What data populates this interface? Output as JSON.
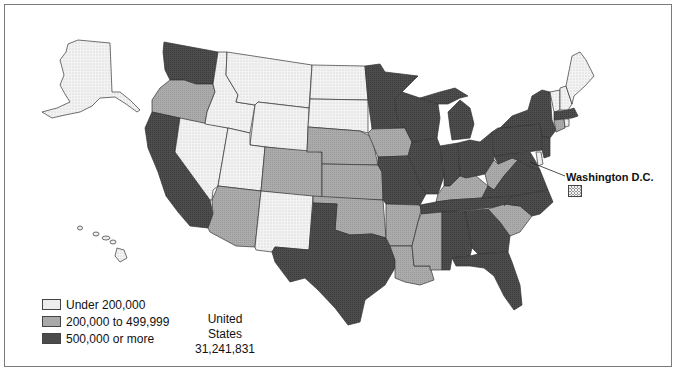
{
  "map": {
    "title": "",
    "total": {
      "label": "United States",
      "value": "31,241,831"
    },
    "dc_label": "Washington D.C.",
    "dc_category": "low"
  },
  "legend": {
    "items": [
      {
        "key": "low",
        "label": "Under 200,000",
        "color": "#f0f0f0"
      },
      {
        "key": "mid",
        "label": "200,000 to 499,999",
        "color": "#a8a8a8"
      },
      {
        "key": "high",
        "label": "500,000 or more",
        "color": "#4a4a4a"
      }
    ]
  },
  "colors": {
    "low": "#efefef",
    "mid": "#a9a9a9",
    "high": "#4b4b4b",
    "stroke": "#333333",
    "frame": "#7a7a7a"
  },
  "states": {
    "low": [
      "Alaska",
      "Hawaii",
      "Montana",
      "Idaho",
      "Wyoming",
      "North Dakota",
      "South Dakota",
      "Nevada",
      "Utah",
      "New Mexico",
      "Maine",
      "Vermont",
      "New Hampshire",
      "Delaware",
      "Rhode Island",
      "Washington D.C."
    ],
    "mid": [
      "Oregon",
      "Colorado",
      "Arizona",
      "Nebraska",
      "Kansas",
      "Oklahoma",
      "Iowa",
      "Arkansas",
      "Louisiana",
      "Mississippi",
      "Kentucky",
      "West Virginia",
      "South Carolina",
      "Connecticut"
    ],
    "high": [
      "Washington",
      "California",
      "Texas",
      "Minnesota",
      "Wisconsin",
      "Missouri",
      "Illinois",
      "Michigan",
      "Indiana",
      "Ohio",
      "Tennessee",
      "Alabama",
      "Georgia",
      "Florida",
      "North Carolina",
      "Virginia",
      "Pennsylvania",
      "New York",
      "New Jersey",
      "Maryland",
      "Massachusetts"
    ]
  }
}
